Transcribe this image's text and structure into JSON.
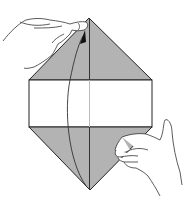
{
  "diagram": {
    "colors": {
      "shaded": "#b3b3b3",
      "paper": "#ffffff",
      "line": "#222222"
    },
    "shape": {
      "top_apex": [
        89,
        18
      ],
      "bottom_apex": [
        90,
        190
      ],
      "band": {
        "left": 29,
        "right": 152,
        "top": 80,
        "bottom": 127
      },
      "center_x": 89.5
    },
    "arrow": {
      "direction": "bottom-to-top",
      "meaning": "fold up"
    },
    "hands": [
      "left hand holding top point",
      "right hand holding lower right edge"
    ]
  }
}
